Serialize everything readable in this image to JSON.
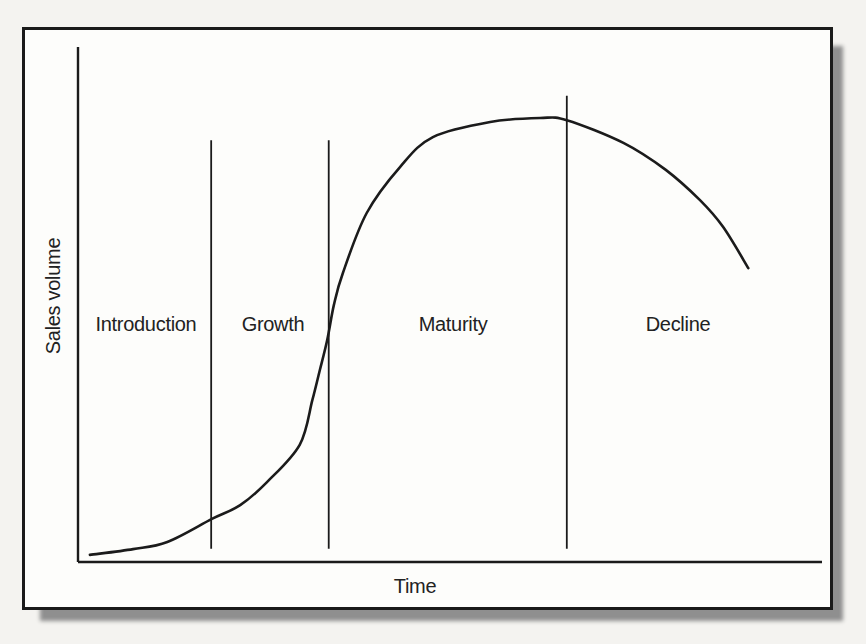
{
  "figure": {
    "y_axis_label": "Sales volume",
    "x_axis_label": "Time",
    "phase_labels": [
      "Introduction",
      "Growth",
      "Maturity",
      "Decline"
    ]
  },
  "chart_data": {
    "type": "line",
    "xlabel": "Time",
    "ylabel": "Sales volume",
    "x_axis": {
      "range": [
        0,
        1
      ],
      "ticks": "none",
      "note": "relative time, unlabeled axis"
    },
    "y_axis": {
      "range": [
        0,
        1
      ],
      "ticks": "none",
      "note": "relative sales volume, 0 = baseline axis, 1 = peak sales"
    },
    "grid": false,
    "legend": "none",
    "phases": [
      {
        "label": "Introduction",
        "x_start": 0.0,
        "x_end": 0.179
      },
      {
        "label": "Growth",
        "x_start": 0.179,
        "x_end": 0.337
      },
      {
        "label": "Maturity",
        "x_start": 0.337,
        "x_end": 0.657
      },
      {
        "label": "Decline",
        "x_start": 0.657,
        "x_end": 1.0
      }
    ],
    "series": [
      {
        "name": "Sales volume",
        "points": [
          [
            0.016,
            0.016
          ],
          [
            0.074,
            0.029
          ],
          [
            0.12,
            0.045
          ],
          [
            0.18,
            0.097
          ],
          [
            0.218,
            0.128
          ],
          [
            0.254,
            0.18
          ],
          [
            0.298,
            0.264
          ],
          [
            0.315,
            0.365
          ],
          [
            0.325,
            0.432
          ],
          [
            0.335,
            0.5
          ],
          [
            0.344,
            0.579
          ],
          [
            0.356,
            0.651
          ],
          [
            0.388,
            0.786
          ],
          [
            0.433,
            0.89
          ],
          [
            0.477,
            0.957
          ],
          [
            0.554,
            0.991
          ],
          [
            0.621,
            1.0
          ],
          [
            0.657,
            0.995
          ],
          [
            0.733,
            0.944
          ],
          [
            0.79,
            0.883
          ],
          [
            0.836,
            0.815
          ],
          [
            0.867,
            0.755
          ],
          [
            0.901,
            0.662
          ]
        ]
      }
    ],
    "layout_hints": {
      "phase_divider_top_frac": [
        0.95,
        0.95,
        1.05
      ],
      "phase_divider_bottom_frac": 0.03
    }
  },
  "colors": {
    "ink": "#1b1b1b",
    "paper": "#fdfdfb",
    "page_background": "#f4f3f0",
    "shadow": "#8f8f8f"
  }
}
